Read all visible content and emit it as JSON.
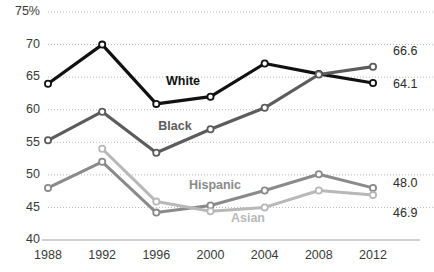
{
  "chart_data": {
    "type": "line",
    "title": "",
    "xlabel": "",
    "ylabel": "",
    "categories": [
      "1988",
      "1992",
      "1996",
      "2000",
      "2004",
      "2008",
      "2012"
    ],
    "x": [
      1988,
      1992,
      1996,
      2000,
      2004,
      2008,
      2012
    ],
    "ylim": [
      40,
      75
    ],
    "yticks": [
      40,
      45,
      50,
      55,
      60,
      65,
      70,
      75
    ],
    "ytick_labels": [
      "40",
      "45",
      "50",
      "55",
      "60",
      "65",
      "70",
      "75%"
    ],
    "grid": true,
    "legend_position": "inline-labels",
    "series": [
      {
        "name": "White",
        "color": "#111111",
        "label_color": "#111111",
        "values": [
          64.0,
          70.0,
          60.9,
          62.0,
          67.1,
          65.5,
          64.1
        ],
        "end_label": "64.1"
      },
      {
        "name": "Black",
        "color": "#5c5c5c",
        "label_color": "#5c5c5c",
        "values": [
          55.3,
          59.7,
          53.4,
          57.0,
          60.3,
          65.4,
          66.6
        ],
        "end_label": "66.6"
      },
      {
        "name": "Hispanic",
        "color": "#8a8a8a",
        "label_color": "#8a8a8a",
        "values": [
          48.0,
          52.0,
          44.2,
          45.3,
          47.6,
          50.1,
          48.0
        ],
        "end_label": "48.0"
      },
      {
        "name": "Asian",
        "color": "#b8b8b8",
        "label_color": "#b8b8b8",
        "values": [
          null,
          54.0,
          45.9,
          44.4,
          45.0,
          47.6,
          46.9
        ],
        "end_label": "46.9"
      }
    ],
    "series_labels": [
      {
        "text": "White",
        "x": 183,
        "y": 82,
        "color": "#111111"
      },
      {
        "text": "Black",
        "x": 175,
        "y": 127,
        "color": "#5c5c5c"
      },
      {
        "text": "Hispanic",
        "x": 215,
        "y": 186,
        "color": "#8a8a8a"
      },
      {
        "text": "Asian",
        "x": 248,
        "y": 219,
        "color": "#b8b8b8"
      }
    ],
    "end_labels": [
      {
        "text": "66.6",
        "x": 393,
        "y": 52,
        "series": "Black"
      },
      {
        "text": "64.1",
        "x": 393,
        "y": 85,
        "series": "White"
      },
      {
        "text": "48.0",
        "x": 393,
        "y": 184,
        "series": "Hispanic"
      },
      {
        "text": "46.9",
        "x": 393,
        "y": 214,
        "series": "Asian"
      }
    ]
  },
  "axis": {
    "y_labels": [
      "75%",
      "70",
      "65",
      "60",
      "55",
      "50",
      "45",
      "40"
    ],
    "x_labels": [
      "1988",
      "1992",
      "1996",
      "2000",
      "2004",
      "2008",
      "2012"
    ]
  }
}
